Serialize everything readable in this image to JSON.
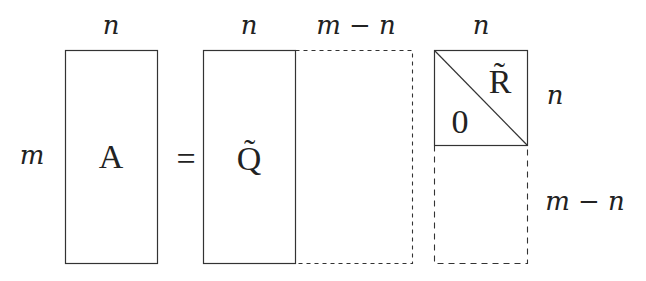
{
  "diagram": {
    "labels": {
      "col_A": "n",
      "col_Q": "n",
      "col_Q_ext": "m − n",
      "col_R": "n",
      "row_A": "m",
      "row_R_top": "n",
      "row_R_bottom": "m − n"
    },
    "matrices": {
      "A": "A",
      "equals": "=",
      "Q": "Q̃",
      "R": "R̃",
      "zero": "0"
    },
    "colors": {
      "line": "#333333",
      "background": "#ffffff"
    }
  }
}
